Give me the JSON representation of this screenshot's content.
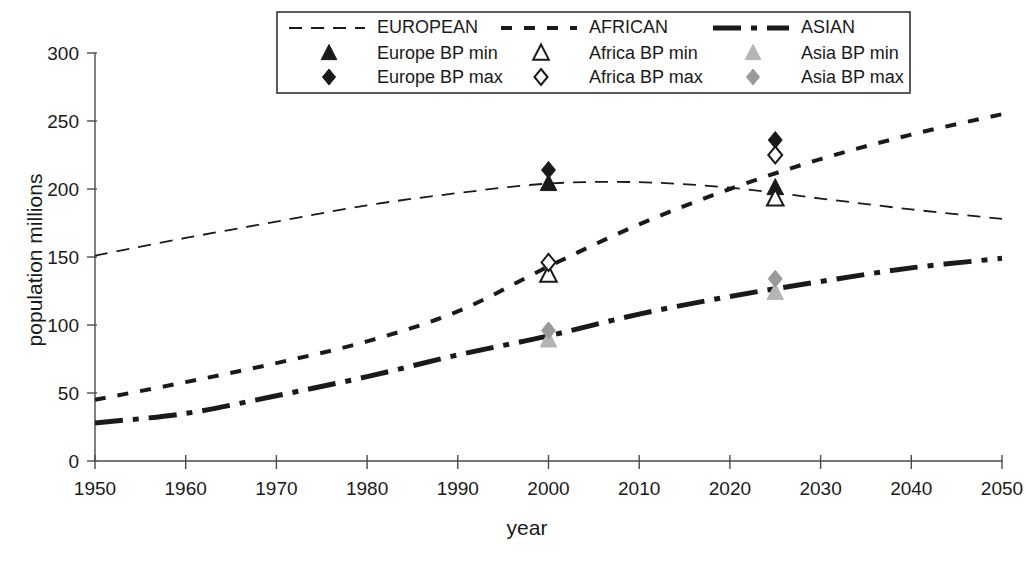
{
  "chart_data": {
    "type": "line",
    "title": "",
    "xlabel": "year",
    "ylabel": "population  millions",
    "xlim": [
      1950,
      2050
    ],
    "ylim": [
      0,
      300
    ],
    "xticks": [
      1950,
      1960,
      1970,
      1980,
      1990,
      2000,
      2010,
      2020,
      2030,
      2040,
      2050
    ],
    "yticks": [
      0,
      50,
      100,
      150,
      200,
      250,
      300
    ],
    "grid": false,
    "legend_position": "top-center",
    "x": [
      1950,
      1960,
      1970,
      1980,
      1990,
      2000,
      2010,
      2020,
      2030,
      2040,
      2050
    ],
    "series": [
      {
        "name": "EUROPEAN",
        "style": "dashed",
        "color": "#1a1a1a",
        "values": [
          151,
          164,
          176,
          188,
          197,
          204,
          205,
          201,
          193,
          185,
          178
        ]
      },
      {
        "name": "AFRICAN",
        "style": "dotted",
        "color": "#1a1a1a",
        "values": [
          45,
          58,
          72,
          88,
          110,
          143,
          174,
          200,
          222,
          240,
          255
        ]
      },
      {
        "name": "ASIAN",
        "style": "dash-dot",
        "color": "#1a1a1a",
        "values": [
          28,
          35,
          48,
          62,
          78,
          92,
          108,
          121,
          132,
          142,
          149
        ]
      }
    ],
    "markers": [
      {
        "name": "Europe  BP min",
        "shape": "triangle",
        "fill": "solid",
        "color": "#1a1a1a",
        "points": [
          {
            "x": 2000,
            "y": 204
          },
          {
            "x": 2025,
            "y": 201
          }
        ]
      },
      {
        "name": "Europe BP max",
        "shape": "diamond",
        "fill": "solid",
        "color": "#1a1a1a",
        "points": [
          {
            "x": 2000,
            "y": 214
          },
          {
            "x": 2025,
            "y": 236
          }
        ]
      },
      {
        "name": "Africa BP min",
        "shape": "triangle",
        "fill": "hollow",
        "color": "#1a1a1a",
        "points": [
          {
            "x": 2000,
            "y": 137
          },
          {
            "x": 2025,
            "y": 193
          }
        ]
      },
      {
        "name": "Africa BP max",
        "shape": "diamond",
        "fill": "hollow",
        "color": "#1a1a1a",
        "points": [
          {
            "x": 2000,
            "y": 146
          },
          {
            "x": 2025,
            "y": 225
          }
        ]
      },
      {
        "name": "Asia  BP min",
        "shape": "triangle",
        "fill": "solid",
        "color": "#b5b5b5",
        "points": [
          {
            "x": 2000,
            "y": 89
          },
          {
            "x": 2025,
            "y": 124
          }
        ]
      },
      {
        "name": "Asia BP max",
        "shape": "diamond",
        "fill": "solid",
        "color": "#9a9a9a",
        "points": [
          {
            "x": 2000,
            "y": 96
          },
          {
            "x": 2025,
            "y": 134
          }
        ]
      }
    ]
  },
  "legend": {
    "rows": [
      [
        {
          "label": "EUROPEAN",
          "key": "line-european"
        },
        {
          "label": "AFRICAN",
          "key": "line-african"
        },
        {
          "label": "ASIAN",
          "key": "line-asian"
        }
      ],
      [
        {
          "label": "Europe  BP min",
          "key": "marker-europe-bp-min"
        },
        {
          "label": "Africa BP min",
          "key": "marker-africa-bp-min"
        },
        {
          "label": "Asia  BP min",
          "key": "marker-asia-bp-min"
        }
      ],
      [
        {
          "label": "Europe BP max",
          "key": "marker-europe-bp-max"
        },
        {
          "label": "Africa BP max",
          "key": "marker-africa-bp-max"
        },
        {
          "label": "Asia BP max",
          "key": "marker-asia-bp-max"
        }
      ]
    ]
  },
  "colors": {
    "axis": "#4a4a4a",
    "text": "#1a1a1a",
    "dark_marker": "#1a1a1a",
    "gray_marker": "#b5b5b5",
    "background": "#ffffff"
  }
}
